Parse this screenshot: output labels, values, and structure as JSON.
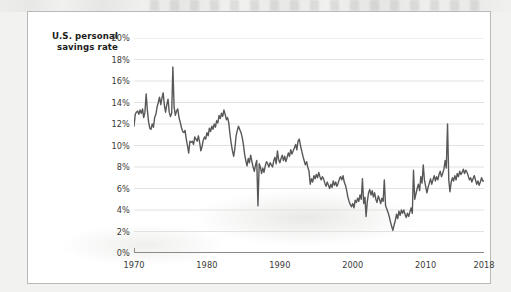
{
  "figure": {
    "title_line1": "U.S. personal",
    "title_line2": "savings rate",
    "card_background": "#ffffff",
    "border_color": "#b9b9b7",
    "page_background": "#f2f2f1"
  },
  "chart_data": {
    "type": "line",
    "title": "U.S. personal savings rate",
    "xlabel": "",
    "ylabel": "",
    "xlim": [
      1970,
      2018
    ],
    "ylim": [
      0,
      20
    ],
    "grid": true,
    "grid_axis": "y",
    "legend": "none",
    "line_color": "#58585a",
    "line_width": 1.4,
    "yticks": [
      0,
      2,
      4,
      6,
      8,
      10,
      12,
      14,
      16,
      18,
      20
    ],
    "ytick_labels": [
      "0%",
      "2%",
      "4%",
      "6%",
      "8%",
      "10%",
      "12%",
      "14%",
      "16%",
      "18%",
      "20%"
    ],
    "xticks": [
      1970,
      1980,
      1990,
      2000,
      2010,
      2018
    ],
    "xtick_labels": [
      "1970",
      "1980",
      "1990",
      "2000",
      "2010",
      "2018"
    ],
    "value_unit": "percent",
    "series": [
      {
        "name": "U.S. personal savings rate",
        "x": [
          1970.0,
          1970.17,
          1970.33,
          1970.5,
          1970.67,
          1970.83,
          1971.0,
          1971.17,
          1971.33,
          1971.5,
          1971.67,
          1971.83,
          1972.0,
          1972.17,
          1972.33,
          1972.5,
          1972.67,
          1972.83,
          1973.0,
          1973.17,
          1973.33,
          1973.5,
          1973.67,
          1973.83,
          1974.0,
          1974.17,
          1974.33,
          1974.5,
          1974.67,
          1974.83,
          1975.0,
          1975.17,
          1975.33,
          1975.5,
          1975.67,
          1975.83,
          1976.0,
          1976.17,
          1976.33,
          1976.5,
          1976.67,
          1976.83,
          1977.0,
          1977.17,
          1977.33,
          1977.5,
          1977.67,
          1977.83,
          1978.0,
          1978.17,
          1978.33,
          1978.5,
          1978.67,
          1978.83,
          1979.0,
          1979.17,
          1979.33,
          1979.5,
          1979.67,
          1979.83,
          1980.0,
          1980.17,
          1980.33,
          1980.5,
          1980.67,
          1980.83,
          1981.0,
          1981.17,
          1981.33,
          1981.5,
          1981.67,
          1981.83,
          1982.0,
          1982.17,
          1982.33,
          1982.5,
          1982.67,
          1982.83,
          1983.0,
          1983.17,
          1983.33,
          1983.5,
          1983.67,
          1983.83,
          1984.0,
          1984.17,
          1984.33,
          1984.5,
          1984.67,
          1984.83,
          1985.0,
          1985.17,
          1985.33,
          1985.5,
          1985.67,
          1985.83,
          1986.0,
          1986.17,
          1986.33,
          1986.5,
          1986.67,
          1986.83,
          1987.0,
          1987.17,
          1987.33,
          1987.5,
          1987.67,
          1987.83,
          1988.0,
          1988.17,
          1988.33,
          1988.5,
          1988.67,
          1988.83,
          1989.0,
          1989.17,
          1989.33,
          1989.5,
          1989.67,
          1989.83,
          1990.0,
          1990.17,
          1990.33,
          1990.5,
          1990.67,
          1990.83,
          1991.0,
          1991.17,
          1991.33,
          1991.5,
          1991.67,
          1991.83,
          1992.0,
          1992.17,
          1992.33,
          1992.5,
          1992.67,
          1992.83,
          1993.0,
          1993.17,
          1993.33,
          1993.5,
          1993.67,
          1993.83,
          1994.0,
          1994.17,
          1994.33,
          1994.5,
          1994.67,
          1994.83,
          1995.0,
          1995.17,
          1995.33,
          1995.5,
          1995.67,
          1995.83,
          1996.0,
          1996.17,
          1996.33,
          1996.5,
          1996.67,
          1996.83,
          1997.0,
          1997.17,
          1997.33,
          1997.5,
          1997.67,
          1997.83,
          1998.0,
          1998.17,
          1998.33,
          1998.5,
          1998.67,
          1998.83,
          1999.0,
          1999.17,
          1999.33,
          1999.5,
          1999.67,
          1999.83,
          2000.0,
          2000.17,
          2000.33,
          2000.5,
          2000.67,
          2000.83,
          2001.0,
          2001.17,
          2001.33,
          2001.5,
          2001.67,
          2001.83,
          2002.0,
          2002.17,
          2002.33,
          2002.5,
          2002.67,
          2002.83,
          2003.0,
          2003.17,
          2003.33,
          2003.5,
          2003.67,
          2003.83,
          2004.0,
          2004.17,
          2004.33,
          2004.5,
          2004.67,
          2004.83,
          2005.0,
          2005.17,
          2005.33,
          2005.5,
          2005.67,
          2005.83,
          2006.0,
          2006.17,
          2006.33,
          2006.5,
          2006.67,
          2006.83,
          2007.0,
          2007.17,
          2007.33,
          2007.5,
          2007.67,
          2007.83,
          2008.0,
          2008.17,
          2008.33,
          2008.5,
          2008.67,
          2008.83,
          2009.0,
          2009.17,
          2009.33,
          2009.5,
          2009.67,
          2009.83,
          2010.0,
          2010.17,
          2010.33,
          2010.5,
          2010.67,
          2010.83,
          2011.0,
          2011.17,
          2011.33,
          2011.5,
          2011.67,
          2011.83,
          2012.0,
          2012.17,
          2012.33,
          2012.5,
          2012.67,
          2012.83,
          2013.0,
          2013.17,
          2013.33,
          2013.5,
          2013.67,
          2013.83,
          2014.0,
          2014.17,
          2014.33,
          2014.5,
          2014.67,
          2014.83,
          2015.0,
          2015.17,
          2015.33,
          2015.5,
          2015.67,
          2015.83,
          2016.0,
          2016.17,
          2016.33,
          2016.5,
          2016.67,
          2016.83,
          2017.0,
          2017.17,
          2017.33,
          2017.5,
          2017.67,
          2017.83,
          2018.0
        ],
        "values": [
          11.8,
          12.9,
          13.1,
          13.2,
          12.9,
          13.3,
          13.0,
          13.4,
          12.6,
          13.1,
          14.8,
          13.3,
          12.2,
          11.6,
          11.5,
          12.0,
          11.7,
          12.6,
          12.9,
          13.6,
          14.0,
          14.5,
          13.8,
          14.4,
          14.9,
          13.7,
          13.1,
          13.8,
          14.3,
          13.1,
          12.7,
          13.0,
          17.3,
          13.6,
          12.8,
          13.2,
          13.4,
          12.6,
          12.2,
          11.7,
          11.3,
          11.2,
          11.4,
          10.6,
          10.0,
          9.3,
          10.4,
          10.3,
          10.4,
          10.1,
          10.8,
          10.6,
          10.4,
          10.9,
          10.3,
          9.5,
          9.9,
          10.5,
          10.8,
          10.6,
          11.2,
          10.9,
          11.6,
          11.3,
          11.8,
          11.5,
          12.0,
          11.7,
          12.3,
          12.1,
          12.8,
          12.5,
          13.0,
          12.7,
          13.3,
          12.9,
          12.4,
          12.6,
          12.1,
          11.0,
          10.2,
          9.5,
          9.0,
          9.7,
          10.9,
          11.4,
          11.8,
          11.5,
          11.2,
          10.8,
          10.1,
          9.2,
          8.6,
          8.1,
          8.8,
          8.4,
          9.1,
          8.5,
          8.0,
          7.6,
          8.2,
          8.6,
          4.4,
          8.3,
          8.0,
          7.4,
          7.9,
          7.5,
          8.1,
          8.5,
          8.3,
          8.0,
          8.4,
          8.2,
          8.0,
          8.6,
          8.9,
          8.3,
          9.5,
          8.7,
          8.4,
          8.8,
          9.1,
          8.6,
          9.0,
          8.5,
          8.9,
          9.3,
          9.0,
          9.6,
          9.2,
          9.5,
          9.8,
          10.1,
          9.6,
          10.4,
          10.6,
          10.0,
          9.5,
          9.0,
          8.6,
          8.2,
          8.5,
          8.0,
          7.6,
          6.4,
          6.9,
          6.6,
          7.2,
          6.9,
          7.3,
          7.0,
          7.5,
          7.1,
          6.8,
          7.1,
          6.9,
          6.5,
          6.2,
          6.6,
          6.3,
          6.0,
          6.4,
          6.1,
          6.7,
          6.3,
          6.6,
          6.2,
          6.5,
          6.9,
          7.1,
          6.8,
          7.2,
          6.6,
          6.3,
          5.8,
          5.2,
          4.8,
          4.5,
          4.3,
          4.6,
          4.2,
          4.9,
          4.7,
          5.1,
          4.8,
          5.4,
          5.0,
          6.9,
          4.6,
          5.2,
          3.4,
          4.8,
          5.6,
          5.9,
          5.4,
          5.8,
          5.2,
          5.6,
          5.0,
          4.7,
          5.3,
          5.0,
          4.6,
          5.1,
          4.8,
          6.8,
          4.4,
          4.1,
          3.8,
          3.4,
          2.9,
          2.5,
          2.1,
          2.6,
          3.0,
          3.6,
          3.2,
          3.9,
          3.5,
          4.0,
          3.7,
          4.0,
          3.6,
          3.3,
          3.7,
          3.4,
          3.8,
          4.2,
          3.7,
          7.7,
          5.0,
          5.5,
          6.0,
          6.4,
          5.8,
          7.1,
          6.5,
          8.2,
          6.8,
          6.2,
          5.6,
          6.1,
          6.5,
          6.9,
          6.4,
          6.8,
          7.2,
          6.7,
          7.1,
          6.8,
          7.3,
          7.6,
          7.1,
          7.4,
          7.8,
          8.6,
          7.9,
          12.0,
          6.8,
          5.7,
          6.6,
          7.0,
          6.7,
          7.2,
          6.8,
          7.4,
          7.1,
          7.6,
          7.3,
          7.5,
          7.8,
          7.4,
          7.7,
          7.5,
          7.2,
          6.8,
          7.0,
          6.6,
          6.9,
          7.2,
          6.8,
          6.4,
          6.7,
          6.3,
          6.6,
          7.0,
          6.7,
          6.7
        ]
      }
    ]
  }
}
